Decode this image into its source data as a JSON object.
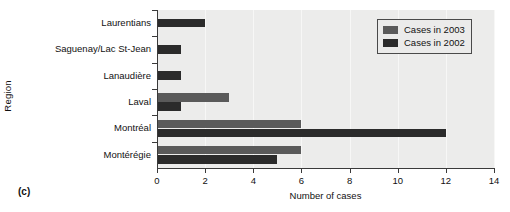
{
  "caption": "(c)",
  "chart_data": {
    "type": "bar",
    "orientation": "horizontal",
    "title": "",
    "xlabel": "Number of cases",
    "ylabel": "Region",
    "categories": [
      "Laurentians",
      "Saguenay/Lac St-Jean",
      "Lanaudière",
      "Laval",
      "Montréal",
      "Montérégie"
    ],
    "series": [
      {
        "name": "Cases in 2003",
        "color": "#5a5a5a",
        "values": [
          0,
          0,
          0,
          3,
          6,
          6
        ]
      },
      {
        "name": "Cases in 2002",
        "color": "#2b2b2b",
        "values": [
          2,
          1,
          1,
          1,
          12,
          5
        ]
      }
    ],
    "xlim": [
      0,
      14
    ],
    "xticks": [
      0,
      2,
      4,
      6,
      8,
      10,
      12,
      14
    ],
    "grid": true,
    "legend_position": "top-right",
    "plot_background": "#ececeb"
  },
  "legend": {
    "entries": [
      {
        "label": "Cases in 2003"
      },
      {
        "label": "Cases in 2002"
      }
    ]
  }
}
